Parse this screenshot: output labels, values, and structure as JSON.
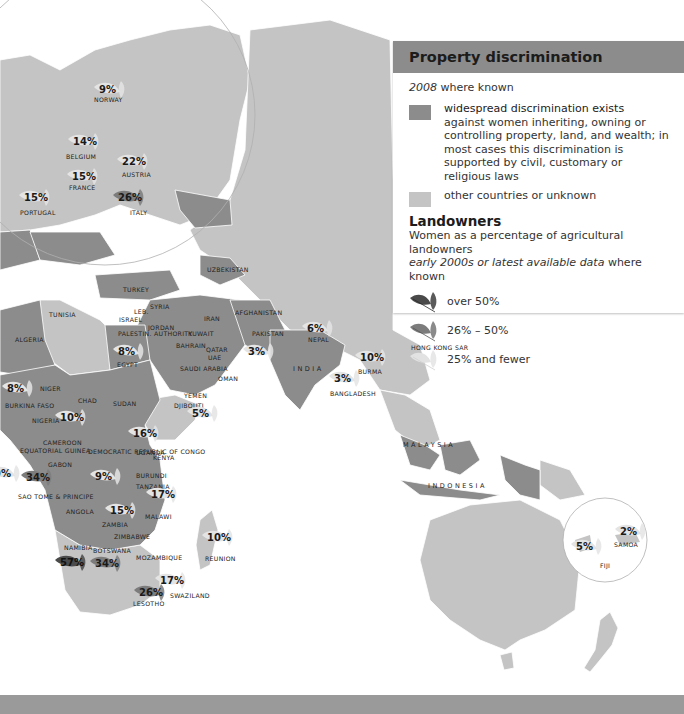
{
  "legend": {
    "title": "Property discrimination",
    "subtitle_year": "2008",
    "subtitle_rest": " where known",
    "categories": [
      {
        "swatch_color": "#8c8c8c",
        "line1": "widespread discrimination exists",
        "line2": "against women inheriting, owning or controlling property, land, and wealth; in most cases this discrimination is supported by civil, customary or religious laws"
      },
      {
        "swatch_color": "#c4c4c4",
        "line1": "other countries or unknown"
      }
    ],
    "landowners": {
      "title": "Landowners",
      "subtitle": "Women as a percentage of agricultural landowners",
      "subtitle2_italic": "early 2000s or latest available data",
      "subtitle2_rest": " where known",
      "bins": [
        {
          "label": "over 50%",
          "color": "#4a4a4a"
        },
        {
          "label": "26% – 50%",
          "color": "#7c7c7c"
        },
        {
          "label": "25% and fewer",
          "color": "#dcdcdc"
        }
      ]
    }
  },
  "colors": {
    "discrimination": "#8c8c8c",
    "other": "#c4c4c4",
    "water": "#ffffff",
    "border": "#ffffff"
  },
  "country_labels": [
    {
      "name": "NORWAY",
      "x": 94,
      "y": 96
    },
    {
      "name": "BELGIUM",
      "x": 66,
      "y": 153
    },
    {
      "name": "FRANCE",
      "x": 69,
      "y": 184
    },
    {
      "name": "AUSTRIA",
      "x": 122,
      "y": 171
    },
    {
      "name": "PORTUGAL",
      "x": 20,
      "y": 209
    },
    {
      "name": "ITALY",
      "x": 130,
      "y": 209
    },
    {
      "name": "UZBEKISTAN",
      "x": 207,
      "y": 266
    },
    {
      "name": "TURKEY",
      "x": 123,
      "y": 286
    },
    {
      "name": "SYRIA",
      "x": 150,
      "y": 303
    },
    {
      "name": "LEB.",
      "x": 134,
      "y": 308
    },
    {
      "name": "ISRAEL",
      "x": 119,
      "y": 316
    },
    {
      "name": "PALESTIN. AUTHORITY",
      "x": 118,
      "y": 330
    },
    {
      "name": "JORDAN",
      "x": 148,
      "y": 324
    },
    {
      "name": "IRAN",
      "x": 204,
      "y": 315
    },
    {
      "name": "AFGHANISTAN",
      "x": 235,
      "y": 309
    },
    {
      "name": "KUWAIT",
      "x": 188,
      "y": 330
    },
    {
      "name": "BAHRAIN",
      "x": 176,
      "y": 342
    },
    {
      "name": "QATAR",
      "x": 206,
      "y": 346
    },
    {
      "name": "UAE",
      "x": 208,
      "y": 354
    },
    {
      "name": "PAKISTAN",
      "x": 252,
      "y": 330
    },
    {
      "name": "NEPAL",
      "x": 308,
      "y": 336
    },
    {
      "name": "TUNISIA",
      "x": 49,
      "y": 311
    },
    {
      "name": "ALGERIA",
      "x": 15,
      "y": 336
    },
    {
      "name": "EGYPT",
      "x": 117,
      "y": 361
    },
    {
      "name": "SAUDI ARABIA",
      "x": 180,
      "y": 365
    },
    {
      "name": "OMAN",
      "x": 218,
      "y": 375
    },
    {
      "name": "INDIA",
      "x": 293,
      "y": 365
    },
    {
      "name": "BURMA",
      "x": 358,
      "y": 368
    },
    {
      "name": "BANGLADESH",
      "x": 330,
      "y": 390
    },
    {
      "name": "Hong Kong SAR",
      "x": 411,
      "y": 344
    },
    {
      "name": "YEMEN",
      "x": 184,
      "y": 392
    },
    {
      "name": "DJIBOUTI",
      "x": 174,
      "y": 402
    },
    {
      "name": "NIGER",
      "x": 40,
      "y": 385
    },
    {
      "name": "CHAD",
      "x": 78,
      "y": 397
    },
    {
      "name": "SUDAN",
      "x": 113,
      "y": 400
    },
    {
      "name": "NIGERIA",
      "x": 32,
      "y": 417
    },
    {
      "name": "BURKINA FASO",
      "x": 5,
      "y": 402
    },
    {
      "name": "CAMEROON",
      "x": 43,
      "y": 439
    },
    {
      "name": "EQUATORIAL GUINEA",
      "x": 20,
      "y": 447
    },
    {
      "name": "GABON",
      "x": 48,
      "y": 461
    },
    {
      "name": "DEMOCRATIC REPUBLIC OF CONGO",
      "x": 88,
      "y": 448
    },
    {
      "name": "UGANDA",
      "x": 136,
      "y": 449
    },
    {
      "name": "KENYA",
      "x": 153,
      "y": 454
    },
    {
      "name": "BURUNDI",
      "x": 136,
      "y": 472
    },
    {
      "name": "TANZANIA",
      "x": 136,
      "y": 483
    },
    {
      "name": "SAO TOME & PRINCIPE",
      "x": 18,
      "y": 493
    },
    {
      "name": "ANGOLA",
      "x": 66,
      "y": 508
    },
    {
      "name": "MALAWI",
      "x": 145,
      "y": 513
    },
    {
      "name": "ZAMBIA",
      "x": 102,
      "y": 521
    },
    {
      "name": "ZIMBABWE",
      "x": 114,
      "y": 533
    },
    {
      "name": "NAMIBIA",
      "x": 64,
      "y": 544
    },
    {
      "name": "BOTSWANA",
      "x": 93,
      "y": 547
    },
    {
      "name": "MOZAMBIQUE",
      "x": 136,
      "y": 554
    },
    {
      "name": "REUNION",
      "x": 205,
      "y": 555
    },
    {
      "name": "SWAZILAND",
      "x": 170,
      "y": 592
    },
    {
      "name": "LESOTHO",
      "x": 133,
      "y": 600
    },
    {
      "name": "MALAYSIA",
      "x": 403,
      "y": 441
    },
    {
      "name": "INDONESIA",
      "x": 428,
      "y": 482
    },
    {
      "name": "SAMOA",
      "x": 614,
      "y": 541
    },
    {
      "name": "FIJI",
      "x": 600,
      "y": 562
    }
  ],
  "landowner_values": [
    {
      "country": "Norway",
      "value": "9%",
      "x": 99,
      "y": 84,
      "bin": "low"
    },
    {
      "country": "Belgium",
      "value": "14%",
      "x": 73,
      "y": 136,
      "bin": "low"
    },
    {
      "country": "France",
      "value": "15%",
      "x": 72,
      "y": 171,
      "bin": "low"
    },
    {
      "country": "Austria",
      "value": "22%",
      "x": 122,
      "y": 156,
      "bin": "low"
    },
    {
      "country": "Portugal",
      "value": "15%",
      "x": 24,
      "y": 192,
      "bin": "low"
    },
    {
      "country": "Italy",
      "value": "26%",
      "x": 118,
      "y": 192,
      "bin": "mid"
    },
    {
      "country": "Egypt",
      "value": "8%",
      "x": 118,
      "y": 346,
      "bin": "low"
    },
    {
      "country": "Pakistan",
      "value": "3%",
      "x": 248,
      "y": 346,
      "bin": "low"
    },
    {
      "country": "Nepal",
      "value": "6%",
      "x": 307,
      "y": 323,
      "bin": "low"
    },
    {
      "country": "Burma",
      "value": "10%",
      "x": 360,
      "y": 352,
      "bin": "low"
    },
    {
      "country": "Bangladesh",
      "value": "3%",
      "x": 334,
      "y": 373,
      "bin": "low"
    },
    {
      "country": "Djibouti",
      "value": "5%",
      "x": 192,
      "y": 408,
      "bin": "low"
    },
    {
      "country": "Burkina Faso",
      "value": "8%",
      "x": 7,
      "y": 383,
      "bin": "low"
    },
    {
      "country": "Cameroon",
      "value": "10%",
      "x": 60,
      "y": 412,
      "bin": "low"
    },
    {
      "country": "Uganda",
      "value": "16%",
      "x": 133,
      "y": 428,
      "bin": "low"
    },
    {
      "country": "DR Congo",
      "value": "9%",
      "x": 95,
      "y": 471,
      "bin": "low"
    },
    {
      "country": "Sao Tome & Principe",
      "value": "34%",
      "x": 26,
      "y": 472,
      "bin": "mid"
    },
    {
      "country": "Tanzania",
      "value": "17%",
      "x": 151,
      "y": 489,
      "bin": "low"
    },
    {
      "country": "Zambia",
      "value": "15%",
      "x": 110,
      "y": 505,
      "bin": "low"
    },
    {
      "country": "Namibia",
      "value": "57%",
      "x": 60,
      "y": 557,
      "bin": "high"
    },
    {
      "country": "Botswana",
      "value": "34%",
      "x": 95,
      "y": 558,
      "bin": "mid"
    },
    {
      "country": "Reunion",
      "value": "10%",
      "x": 207,
      "y": 532,
      "bin": "low"
    },
    {
      "country": "Swaziland",
      "value": "17%",
      "x": 160,
      "y": 575,
      "bin": "low"
    },
    {
      "country": "Lesotho",
      "value": "26%",
      "x": 139,
      "y": 587,
      "bin": "mid"
    },
    {
      "country": "Samoa",
      "value": "2%",
      "x": 620,
      "y": 526,
      "bin": "low"
    },
    {
      "country": "Fiji",
      "value": "5%",
      "x": 576,
      "y": 541,
      "bin": "low"
    },
    {
      "country": "Morocco/edge",
      "value": "9%",
      "x": -6,
      "y": 468,
      "bin": "low"
    }
  ]
}
